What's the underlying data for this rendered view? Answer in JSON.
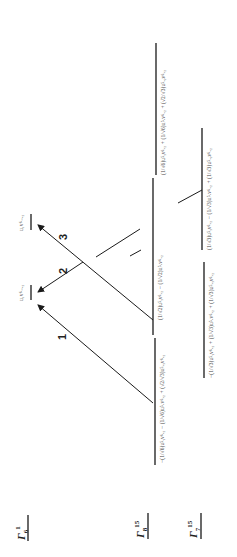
{
  "figure": {
    "orientation": "rotated 90 degrees counter-clockwise",
    "rows": [
      {
        "id": "gamma6_1",
        "label": "Γ",
        "sup": "1",
        "sub": "6"
      },
      {
        "id": "gamma8_15",
        "label": "Γ",
        "sup": "15",
        "sub": "8"
      },
      {
        "id": "gamma7_15",
        "label": "Γ",
        "sup": "15",
        "sub": "7"
      }
    ],
    "levels": {
      "gamma6": {
        "state": "u₁v⁶₋ₓ₂"
      },
      "gamma8": [
        {
          "state": "−(1/√6)u⁵ᵧv⁶ₓ₂ − (1/√6)u⁵ₓv⁶ₓ₂ + (√2/√3)u⁵ₓᵧv⁶ₓ₂"
        },
        {
          "state": "(1/√2)u⁵ᵧv⁶ₓ₂ − (1/√2)u⁵ₓv⁶ₓ₂"
        },
        {
          "state": "(1/√6)u⁵ᵧv⁶ₓ₂ + (1/√6)u⁵ₓv⁶ₓ₂ + (√2/√3)u⁵ₓᵧv⁶ₓ₂"
        }
      ],
      "gamma7": [
        {
          "state": "−(1/√3)u⁵ᵧv⁶ₓ₂ + (1/√3)u⁵ₓv⁶ₓ₂ + (1/√3)u⁵ₓᵧv⁶ₓ₂"
        },
        {
          "state": "(1/√3)u⁵ᵧv⁶ₓ₂ − (1/√3)u⁵ₓv⁶ₓ₂ + (1/√3)u⁵ₓᵧv⁶ₓ₂"
        }
      ]
    },
    "transitions": [
      {
        "label": "1"
      },
      {
        "label": "2"
      },
      {
        "label": "3"
      }
    ]
  }
}
